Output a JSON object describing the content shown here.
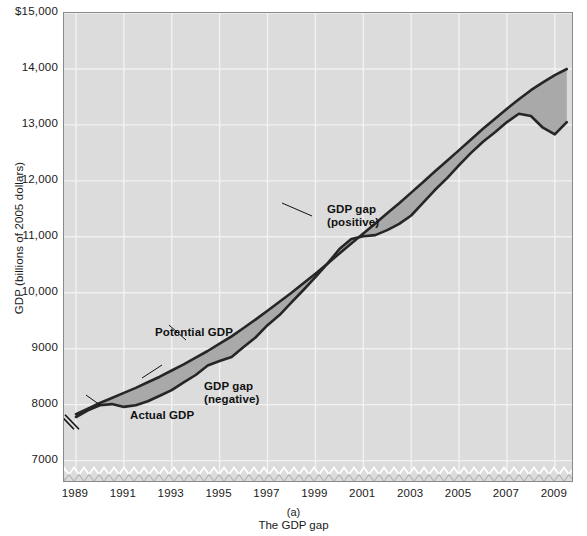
{
  "figure": {
    "caption_letter": "(a)",
    "caption_title": "The GDP gap"
  },
  "chart_data": {
    "type": "line",
    "title": "The GDP gap",
    "xlabel": "",
    "ylabel": "GDP (billions of 2005 dollars)",
    "xlim": [
      1988.5,
      2009.8
    ],
    "ylim": [
      6600,
      15000
    ],
    "y_ticks": [
      "$15,000",
      "14,000",
      "13,000",
      "12,000",
      "11,000",
      "10,000",
      "9000",
      "8000",
      "7000"
    ],
    "y_tick_values": [
      15000,
      14000,
      13000,
      12000,
      11000,
      10000,
      9000,
      8000,
      7000
    ],
    "x_ticks": [
      "1989",
      "1991",
      "1993",
      "1995",
      "1997",
      "1999",
      "2001",
      "2003",
      "2005",
      "2007",
      "2009"
    ],
    "x_tick_values": [
      1989,
      1991,
      1993,
      1995,
      1997,
      1999,
      2001,
      2003,
      2005,
      2007,
      2009
    ],
    "axis_break": true,
    "grid": true,
    "grid_color": "#f2f2f2",
    "plot_background": "#dcdcdc",
    "line_color": "#262626",
    "gap_fill_color": "#a9a9a9",
    "legend_position": "in-plot annotations",
    "x": [
      1989,
      1989.5,
      1990,
      1990.5,
      1991,
      1991.5,
      1992,
      1992.5,
      1993,
      1993.5,
      1994,
      1994.5,
      1995,
      1995.5,
      1996,
      1996.5,
      1997,
      1997.5,
      1998,
      1998.5,
      1999,
      1999.5,
      2000,
      2000.5,
      2001,
      2001.5,
      2002,
      2002.5,
      2003,
      2003.5,
      2004,
      2004.5,
      2005,
      2005.5,
      2006,
      2006.5,
      2007,
      2007.5,
      2008,
      2008.5,
      2009,
      2009.5
    ],
    "series": [
      {
        "name": "Potential GDP",
        "values": [
          7830,
          7930,
          8030,
          8120,
          8210,
          8300,
          8400,
          8500,
          8610,
          8720,
          8840,
          8960,
          9090,
          9220,
          9370,
          9520,
          9680,
          9840,
          10000,
          10170,
          10340,
          10520,
          10700,
          10880,
          11060,
          11240,
          11420,
          11600,
          11790,
          11980,
          12170,
          12360,
          12550,
          12740,
          12930,
          13110,
          13290,
          13460,
          13620,
          13760,
          13890,
          14000
        ]
      },
      {
        "name": "Actual GDP",
        "values": [
          7780,
          7900,
          7990,
          8010,
          7960,
          7990,
          8060,
          8160,
          8260,
          8400,
          8530,
          8700,
          8780,
          8850,
          9030,
          9200,
          9420,
          9600,
          9830,
          10050,
          10280,
          10520,
          10780,
          10960,
          11010,
          11030,
          11120,
          11230,
          11380,
          11610,
          11840,
          12050,
          12280,
          12500,
          12700,
          12870,
          13050,
          13200,
          13160,
          12950,
          12830,
          13050
        ]
      }
    ],
    "annotations": [
      {
        "id": "potential-gdp",
        "text": "Potential GDP",
        "bold": true
      },
      {
        "id": "actual-gdp",
        "text": "Actual GDP",
        "bold": true
      },
      {
        "id": "gap-negative-line1",
        "text": "GDP gap",
        "bold": true
      },
      {
        "id": "gap-negative-line2",
        "text": "(negative)",
        "bold": true
      },
      {
        "id": "gap-positive-line1",
        "text": "GDP gap",
        "bold": true
      },
      {
        "id": "gap-positive-line2",
        "text": "(positive)",
        "bold": true
      }
    ]
  },
  "yaxis": {
    "title": "GDP (billions of 2005 dollars)",
    "ticks": [
      {
        "label": "$15,000"
      },
      {
        "label": "14,000"
      },
      {
        "label": "13,000"
      },
      {
        "label": "12,000"
      },
      {
        "label": "11,000"
      },
      {
        "label": "10,000"
      },
      {
        "label": "9000"
      },
      {
        "label": "8000"
      },
      {
        "label": "7000"
      }
    ]
  },
  "xaxis": {
    "ticks": [
      {
        "label": "1989"
      },
      {
        "label": "1991"
      },
      {
        "label": "1993"
      },
      {
        "label": "1995"
      },
      {
        "label": "1997"
      },
      {
        "label": "1999"
      },
      {
        "label": "2001"
      },
      {
        "label": "2003"
      },
      {
        "label": "2005"
      },
      {
        "label": "2007"
      },
      {
        "label": "2009"
      }
    ]
  },
  "annotations": {
    "potential_gdp": "Potential GDP",
    "actual_gdp": "Actual GDP",
    "gap_negative_l1": "GDP gap",
    "gap_negative_l2": "(negative)",
    "gap_positive_l1": "GDP gap",
    "gap_positive_l2": "(positive)"
  }
}
